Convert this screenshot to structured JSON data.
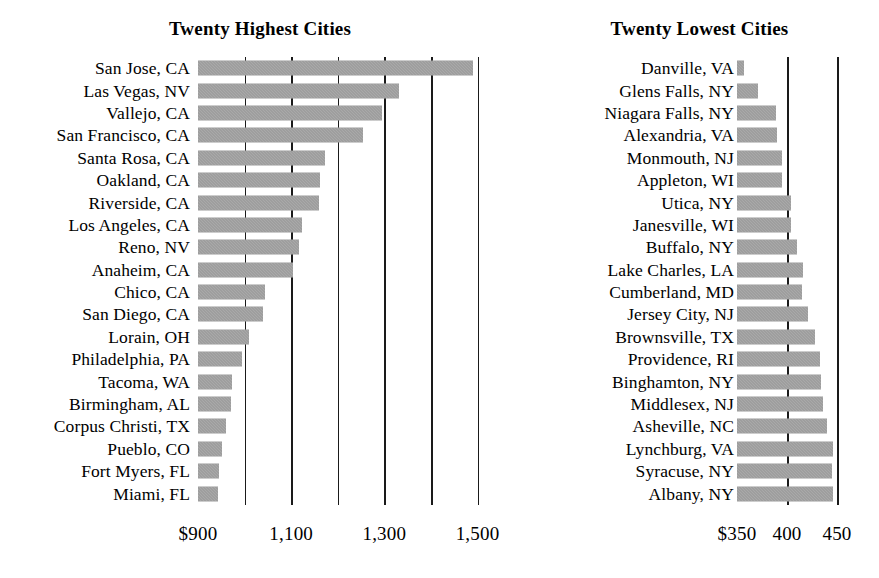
{
  "chart_data": [
    {
      "type": "bar",
      "orientation": "horizontal",
      "title": "Twenty Highest Cities",
      "xlabel": "",
      "ylabel": "",
      "xlim": [
        900,
        1520
      ],
      "grid": true,
      "legend": null,
      "axis_tick_values": [
        900,
        1100,
        1300,
        1500
      ],
      "axis_tick_labels": [
        "$900",
        "1,100",
        "1,300",
        "1,500"
      ],
      "gridline_values": [
        1000,
        1100,
        1200,
        1300,
        1400,
        1500
      ],
      "bar_color": "#939393",
      "categories": [
        "San Jose, CA",
        "Las Vegas, NV",
        "Vallejo, CA",
        "San Francisco, CA",
        "Santa Rosa, CA",
        "Oakland, CA",
        "Riverside, CA",
        "Los Angeles, CA",
        "Reno, NV",
        "Anaheim, CA",
        "Chico, CA",
        "San Diego, CA",
        "Lorain, OH",
        "Philadelphia, PA",
        "Tacoma, WA",
        "Birmingham, AL",
        "Corpus Christi, TX",
        "Pueblo, CO",
        "Fort Myers, FL",
        "Miami, FL"
      ],
      "values": [
        1490,
        1331,
        1295,
        1254,
        1172,
        1162,
        1160,
        1123,
        1117,
        1104,
        1044,
        1040,
        1010,
        994,
        973,
        971,
        960,
        952,
        945,
        942
      ]
    },
    {
      "type": "bar",
      "orientation": "horizontal",
      "title": "Twenty Lowest Cities",
      "xlabel": "",
      "ylabel": "",
      "xlim": [
        350,
        453
      ],
      "grid": true,
      "legend": null,
      "axis_tick_values": [
        350,
        400,
        450
      ],
      "axis_tick_labels": [
        "$350",
        "400",
        "450"
      ],
      "gridline_values": [
        400,
        450
      ],
      "bar_color": "#939393",
      "categories": [
        "Danville, VA",
        "Glens Falls, NY",
        "Niagara Falls, NY",
        "Alexandria, VA",
        "Monmouth, NJ",
        "Appleton, WI",
        "Utica, NY",
        "Janesville, WI",
        "Buffalo, NY",
        "Lake Charles, LA",
        "Cumberland, MD",
        "Jersey City, NJ",
        "Brownsville, TX",
        "Providence, RI",
        "Binghamton, NY",
        "Middlesex, NJ",
        "Asheville, NC",
        "Lynchburg, VA",
        "Syracuse, NY",
        "Albany, NY"
      ],
      "values": [
        357,
        371,
        389,
        390,
        395,
        395,
        404,
        404,
        410,
        416,
        415,
        421,
        428,
        433,
        434,
        436,
        440,
        446,
        445,
        446
      ]
    }
  ]
}
